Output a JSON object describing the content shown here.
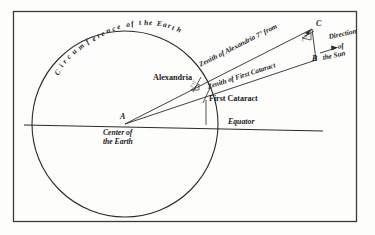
{
  "figure": {
    "title_context": "Eratosthenes measurement of the circumference of the Earth",
    "background_color": "#fdfdfc",
    "ink_color": "#1b1b1b",
    "border": {
      "x": 13,
      "y": 11,
      "width": 344,
      "height": 211
    }
  },
  "geometry": {
    "earth_circle": {
      "cx": 125,
      "cy": 124,
      "r": 93
    },
    "equator_line": {
      "x1": 24,
      "y1": 125,
      "x2": 323,
      "y2": 131
    },
    "point_a": {
      "x": 125,
      "y": 124
    },
    "point_c": {
      "x": 312,
      "y": 29
    },
    "point_b": {
      "x": 316,
      "y": 60
    },
    "alexandria_point": {
      "x": 196,
      "y": 84
    },
    "first_cataract_point": {
      "x": 206,
      "y": 94
    }
  },
  "labels": {
    "circumference": "Circumference of the Earth",
    "circumference_letters": [
      "C",
      "i",
      "r",
      "c",
      "u",
      "m",
      "f",
      "e",
      "r",
      "e",
      "n",
      "c",
      "e",
      " ",
      "o",
      "f",
      " ",
      "t",
      "h",
      "e",
      " ",
      "E",
      "a",
      "r",
      "t",
      "h"
    ],
    "alexandria": "Alexandria",
    "zenith_of_alexandria": "Zenith of Alexandria 7° from",
    "zenith_of_first_cataract": "Zenith of First Cataract",
    "first_cataract": "First Cataract",
    "point_a": "A",
    "point_b": "B",
    "point_c": "C",
    "center_of_the_earth_line1": "Center of",
    "center_of_the_earth_line2": "the Earth",
    "equator": "Equator",
    "direction_line1": "Direction",
    "direction_line2": "of",
    "direction_line3": "the Sun",
    "angle_at_alexandria": "7°12'",
    "angle_at_b": "7°12'"
  }
}
